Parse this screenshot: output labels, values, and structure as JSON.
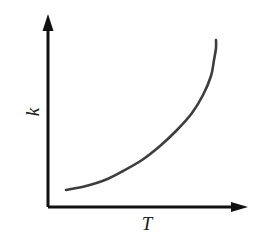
{
  "figure": {
    "name": "rate-constant-vs-temperature-plot",
    "background_color": "#ffffff",
    "width": 264,
    "height": 238
  },
  "axes": {
    "color": "#111111",
    "line_width": 3,
    "origin": {
      "x": 48,
      "y": 207
    },
    "x_axis": {
      "label": "T",
      "label_name": "temperature",
      "from": {
        "x": 48,
        "y": 207
      },
      "to": {
        "x": 248,
        "y": 207
      },
      "arrowhead": "solid-triangle-right"
    },
    "y_axis": {
      "label": "k",
      "label_name": "rate-constant",
      "from": {
        "x": 48,
        "y": 207
      },
      "to": {
        "x": 48,
        "y": 14
      },
      "arrowhead": "solid-triangle-up"
    }
  },
  "chart_data": {
    "type": "line",
    "title": "",
    "subtitle": "",
    "xlabel": "T",
    "ylabel": "k",
    "grid": false,
    "legend": false,
    "legend_position": "none",
    "xlim": [
      0,
      1
    ],
    "ylim": [
      0,
      1
    ],
    "x_tick_labels": [],
    "y_tick_labels": [],
    "series": [
      {
        "name": "k(T)",
        "color": "#3d3d3d",
        "line_width": 2.6,
        "style": "solid",
        "shape": "exponential-increasing",
        "x": [
          0.09,
          0.19,
          0.29,
          0.38,
          0.48,
          0.57,
          0.66,
          0.74,
          0.81,
          0.87,
          0.92,
          0.96,
          1.0
        ],
        "y": [
          0.09,
          0.12,
          0.16,
          0.21,
          0.27,
          0.34,
          0.42,
          0.51,
          0.61,
          0.71,
          0.8,
          0.88,
          0.96
        ],
        "pixel_points": [
          {
            "x": 66,
            "y": 190
          },
          {
            "x": 86,
            "y": 186
          },
          {
            "x": 105,
            "y": 180
          },
          {
            "x": 123,
            "y": 171
          },
          {
            "x": 142,
            "y": 160
          },
          {
            "x": 160,
            "y": 146
          },
          {
            "x": 177,
            "y": 130
          },
          {
            "x": 192,
            "y": 113
          },
          {
            "x": 203,
            "y": 95
          },
          {
            "x": 211,
            "y": 76
          },
          {
            "x": 214,
            "y": 60
          },
          {
            "x": 216,
            "y": 48
          },
          {
            "x": 216,
            "y": 40
          }
        ]
      }
    ],
    "annotations": []
  }
}
